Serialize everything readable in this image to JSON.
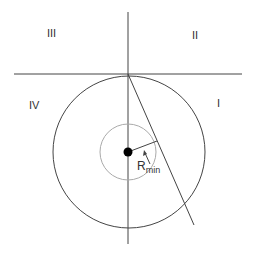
{
  "diagram": {
    "quadrants": {
      "q1": "I",
      "q2": "II",
      "q3": "III",
      "q4": "IV"
    },
    "radius_label": {
      "main": "R",
      "subscript": "min"
    },
    "colors": {
      "line": "#444444",
      "inner_circle": "#aaaaaa",
      "dot": "#000000"
    }
  }
}
